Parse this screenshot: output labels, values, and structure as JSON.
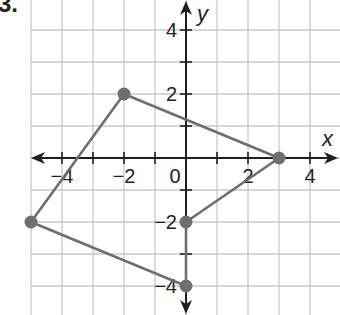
{
  "problem": {
    "number": "3."
  },
  "chart_data": {
    "type": "scatter",
    "title": "",
    "xlabel": "x",
    "ylabel": "y",
    "xlim": [
      -5,
      5
    ],
    "ylim": [
      -4.5,
      5
    ],
    "grid": true,
    "x_ticks": [
      -4,
      -2,
      0,
      2,
      4
    ],
    "y_ticks": [
      4,
      2,
      -2,
      -4
    ],
    "tick_labels": {
      "x": [
        "−4",
        "−2",
        "0",
        "2",
        "4"
      ],
      "y": [
        "4",
        "2",
        "−2",
        "−4"
      ]
    },
    "series": [
      {
        "name": "polygon",
        "closed": true,
        "points": [
          {
            "x": -2,
            "y": 2
          },
          {
            "x": 3,
            "y": 0
          },
          {
            "x": 0,
            "y": -2
          },
          {
            "x": 0,
            "y": -4
          },
          {
            "x": -5,
            "y": -2
          }
        ]
      }
    ],
    "colors": {
      "polygon": "#6e6e6e",
      "grid": "#c9c9c9",
      "axis": "#1f1f1f"
    }
  }
}
